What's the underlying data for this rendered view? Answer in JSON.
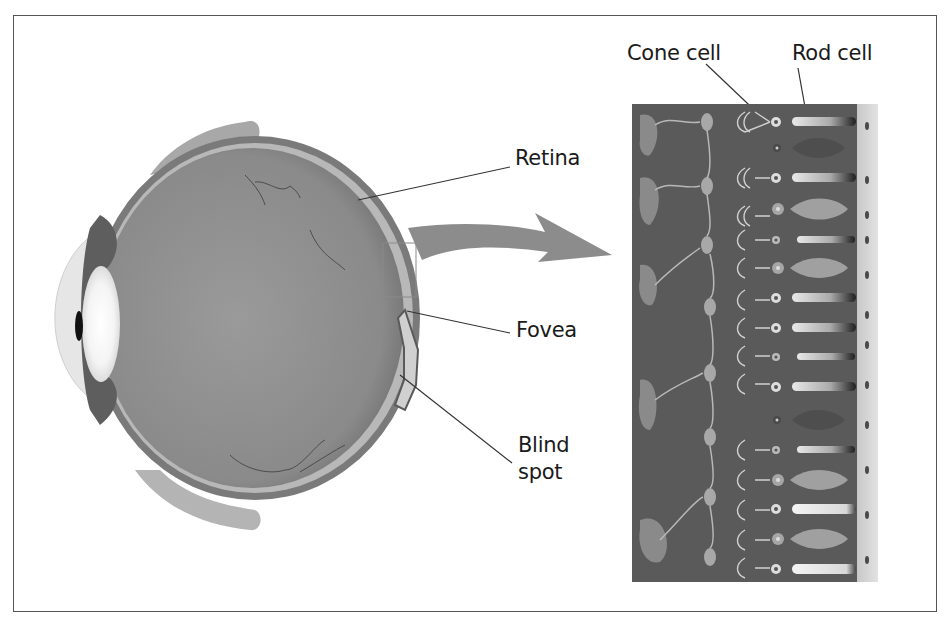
{
  "figure": {
    "labels": {
      "retina": "Retina",
      "fovea": "Fovea",
      "blind_spot_line1": "Blind",
      "blind_spot_line2": "spot",
      "cone_cell": "Cone cell",
      "rod_cell": "Rod cell"
    },
    "colors": {
      "frame": "#555555",
      "eyeball": "#8a8a8a",
      "retina_panel": "#5a5a5a",
      "arrow": "#8c8c8c",
      "cell_light": "#d8d8d8",
      "text": "#1a1a1a"
    }
  }
}
